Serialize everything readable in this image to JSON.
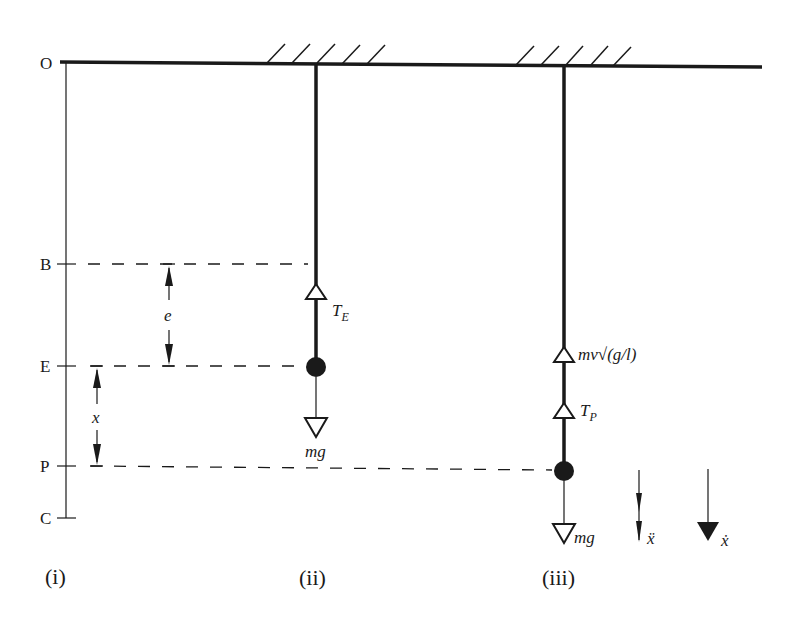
{
  "figure": {
    "point_labels": {
      "O": "O",
      "B": "B",
      "E": "E",
      "P": "P",
      "C": "C"
    },
    "dimension_labels": {
      "extension": "e",
      "displacement": "x"
    },
    "panel_ii": {
      "caption": "(ii)",
      "tension_label": "T",
      "tension_subscript": "E",
      "weight_label": "mg"
    },
    "panel_iii": {
      "caption": "(iii)",
      "resistance_label": "mv√(g/l)",
      "tension_label": "T",
      "tension_subscript": "P",
      "weight_label": "mg",
      "acceleration_label": "ẍ",
      "velocity_label": "ẋ"
    },
    "panel_i": {
      "caption": "(i)"
    },
    "colors": {
      "ink": "#1a1a1a",
      "background": "#ffffff"
    }
  }
}
